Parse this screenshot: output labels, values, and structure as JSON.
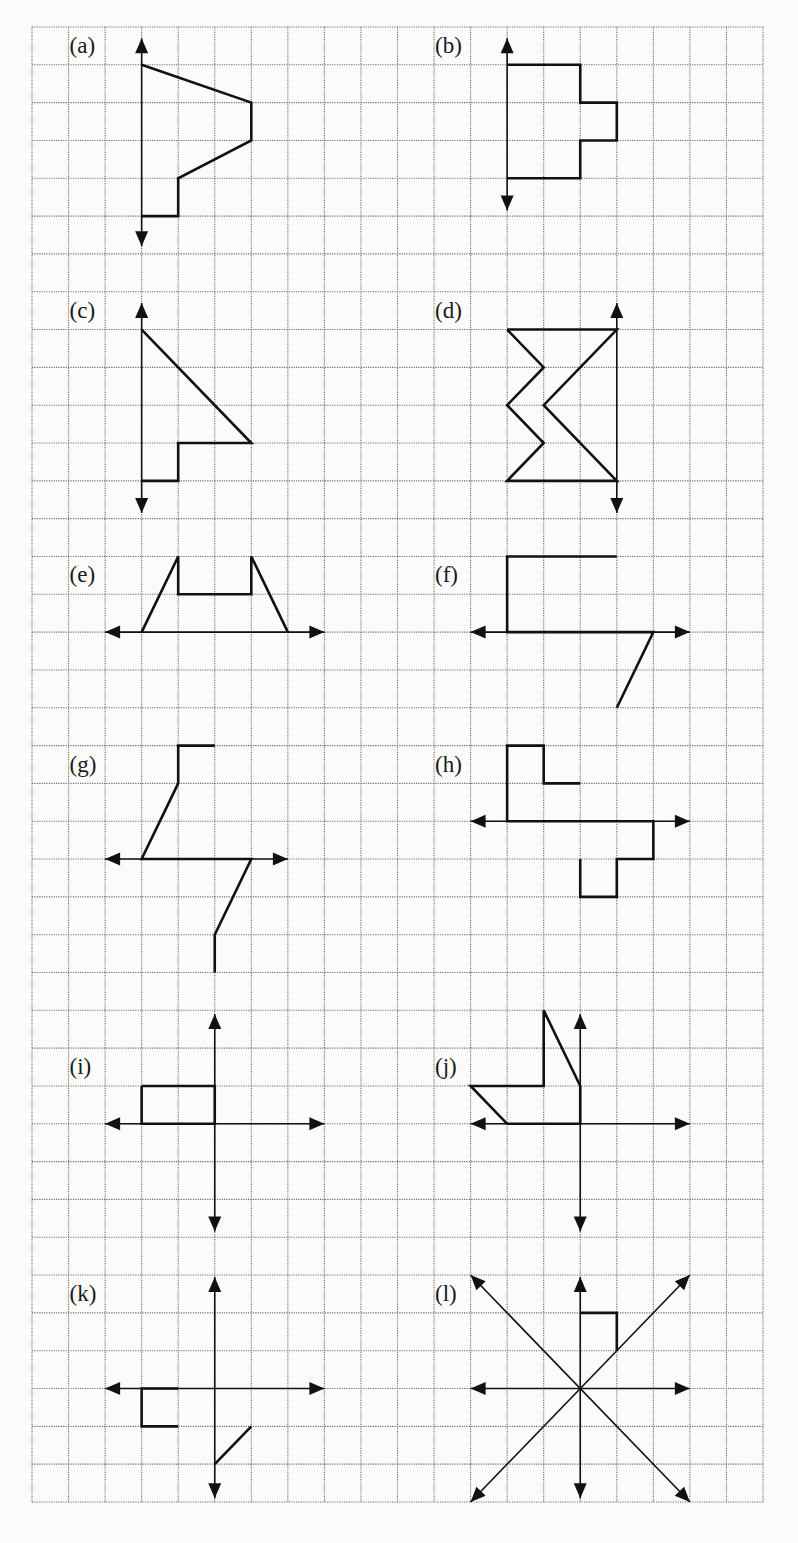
{
  "worksheet": {
    "grid": {
      "origin_x": 32,
      "origin_y": 27,
      "cell_w": 36.55,
      "cell_h": 37.82,
      "cols": 20,
      "rows": 39,
      "line_color": "#6e6e6e",
      "ink_color": "#111111"
    },
    "figures": [
      {
        "id": "a",
        "label": "(a)",
        "label_pos": [
          1,
          0
        ],
        "axes": [
          {
            "dir": "v",
            "at": 3,
            "from": 0.3,
            "to": 5.8,
            "heads": "both"
          }
        ],
        "paths": [
          [
            [
              3,
              1
            ],
            [
              6,
              2
            ],
            [
              6,
              3
            ],
            [
              4,
              4
            ],
            [
              4,
              5
            ],
            [
              3,
              5
            ]
          ]
        ]
      },
      {
        "id": "b",
        "label": "(b)",
        "label_pos": [
          11,
          0
        ],
        "axes": [
          {
            "dir": "v",
            "at": 13,
            "from": 0.3,
            "to": 4.85,
            "heads": "both"
          }
        ],
        "paths": [
          [
            [
              13,
              1
            ],
            [
              15,
              1
            ],
            [
              15,
              2
            ],
            [
              16,
              2
            ],
            [
              16,
              3
            ],
            [
              15,
              3
            ],
            [
              15,
              4
            ],
            [
              13,
              4
            ]
          ]
        ]
      },
      {
        "id": "c",
        "label": "(c)",
        "label_pos": [
          1,
          7
        ],
        "axes": [
          {
            "dir": "v",
            "at": 3,
            "from": 7.3,
            "to": 12.85,
            "heads": "both"
          }
        ],
        "paths": [
          [
            [
              3,
              8
            ],
            [
              6,
              11
            ],
            [
              4,
              11
            ],
            [
              4,
              12
            ],
            [
              3,
              12
            ]
          ]
        ]
      },
      {
        "id": "d",
        "label": "(d)",
        "label_pos": [
          11,
          7
        ],
        "axes": [
          {
            "dir": "v",
            "at": 16,
            "from": 7.3,
            "to": 12.85,
            "heads": "both"
          }
        ],
        "paths": [
          [
            [
              13,
              8
            ],
            [
              16,
              8
            ],
            [
              14,
              10
            ],
            [
              16,
              12
            ],
            [
              13,
              12
            ],
            [
              14,
              11
            ],
            [
              13,
              10
            ],
            [
              14,
              9
            ],
            [
              13,
              8
            ]
          ]
        ]
      },
      {
        "id": "e",
        "label": "(e)",
        "label_pos": [
          1,
          14
        ],
        "axes": [
          {
            "dir": "h",
            "at": 16,
            "from": 2,
            "to": 8,
            "heads": "both"
          }
        ],
        "paths": [
          [
            [
              3,
              16
            ],
            [
              4,
              14
            ],
            [
              4,
              15
            ],
            [
              6,
              15
            ],
            [
              6,
              14
            ],
            [
              7,
              16
            ]
          ]
        ]
      },
      {
        "id": "f",
        "label": "(f)",
        "label_pos": [
          11,
          14
        ],
        "axes": [
          {
            "dir": "h",
            "at": 16,
            "from": 12,
            "to": 18,
            "heads": "both"
          }
        ],
        "paths": [
          [
            [
              16,
              14
            ],
            [
              13,
              14
            ],
            [
              13,
              16
            ],
            [
              17,
              16
            ],
            [
              16,
              18
            ]
          ]
        ]
      },
      {
        "id": "g",
        "label": "(g)",
        "label_pos": [
          1,
          19
        ],
        "axes": [
          {
            "dir": "h",
            "at": 22,
            "from": 2,
            "to": 7,
            "heads": "both"
          }
        ],
        "paths": [
          [
            [
              5,
              19
            ],
            [
              4,
              19
            ],
            [
              4,
              20
            ],
            [
              3,
              22
            ],
            [
              6,
              22
            ],
            [
              5,
              24
            ],
            [
              5,
              25
            ]
          ]
        ]
      },
      {
        "id": "h",
        "label": "(h)",
        "label_pos": [
          11,
          19
        ],
        "axes": [
          {
            "dir": "h",
            "at": 21,
            "from": 12,
            "to": 18,
            "heads": "both"
          }
        ],
        "paths": [
          [
            [
              15,
              20
            ],
            [
              14,
              20
            ],
            [
              14,
              19
            ],
            [
              13,
              19
            ],
            [
              13,
              21
            ],
            [
              17,
              21
            ],
            [
              17,
              22
            ],
            [
              16,
              22
            ],
            [
              16,
              23
            ],
            [
              15,
              23
            ],
            [
              15,
              22
            ]
          ]
        ]
      },
      {
        "id": "i",
        "label": "(i)",
        "label_pos": [
          1,
          27
        ],
        "axes": [
          {
            "dir": "h",
            "at": 29,
            "from": 2,
            "to": 8,
            "heads": "both"
          },
          {
            "dir": "v",
            "at": 5,
            "from": 26.1,
            "to": 31.85,
            "heads": "both"
          }
        ],
        "paths": [
          [
            [
              3,
              28
            ],
            [
              5,
              28
            ],
            [
              5,
              29
            ],
            [
              3,
              29
            ],
            [
              3,
              28
            ]
          ]
        ]
      },
      {
        "id": "j",
        "label": "(j)",
        "label_pos": [
          11,
          27
        ],
        "axes": [
          {
            "dir": "h",
            "at": 29,
            "from": 12,
            "to": 18,
            "heads": "both"
          },
          {
            "dir": "v",
            "at": 15,
            "from": 26.1,
            "to": 31.85,
            "heads": "both"
          }
        ],
        "paths": [
          [
            [
              14,
              26
            ],
            [
              15,
              28
            ],
            [
              15,
              29
            ],
            [
              13,
              29
            ],
            [
              12,
              28
            ],
            [
              14,
              28
            ],
            [
              14,
              26
            ]
          ]
        ]
      },
      {
        "id": "k",
        "label": "(k)",
        "label_pos": [
          1,
          33
        ],
        "axes": [
          {
            "dir": "h",
            "at": 36,
            "from": 2,
            "to": 8,
            "heads": "both"
          },
          {
            "dir": "v",
            "at": 5,
            "from": 33.05,
            "to": 38.9,
            "heads": "both"
          }
        ],
        "paths": [
          [
            [
              4,
              36
            ],
            [
              3,
              36
            ],
            [
              3,
              37
            ],
            [
              4,
              37
            ]
          ],
          [
            [
              6,
              37
            ],
            [
              5,
              38
            ]
          ]
        ]
      },
      {
        "id": "l",
        "label": "(l)",
        "label_pos": [
          11,
          33
        ],
        "axes": [
          {
            "dir": "h",
            "at": 36,
            "from": 12,
            "to": 18,
            "heads": "both"
          },
          {
            "dir": "v",
            "at": 15,
            "from": 33.05,
            "to": 38.9,
            "heads": "both"
          },
          {
            "dir": "d",
            "from_pt": [
              12,
              33
            ],
            "to_pt": [
              18,
              39
            ],
            "heads": "both"
          },
          {
            "dir": "d",
            "from_pt": [
              18,
              33
            ],
            "to_pt": [
              12,
              39
            ],
            "heads": "both"
          }
        ],
        "paths": [
          [
            [
              15,
              34
            ],
            [
              16,
              34
            ],
            [
              16,
              35
            ]
          ]
        ]
      }
    ]
  }
}
